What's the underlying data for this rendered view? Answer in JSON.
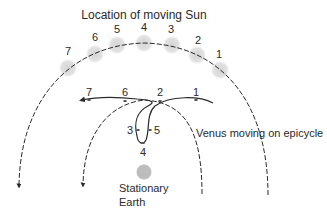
{
  "title": "Location of moving Sun",
  "sun_positions": [
    {
      "label": "7",
      "cx": 68,
      "cy": 68,
      "lx": 68,
      "ly": 55
    },
    {
      "label": "6",
      "cx": 95,
      "cy": 54,
      "lx": 95,
      "ly": 41
    },
    {
      "label": "5",
      "cx": 117,
      "cy": 45,
      "lx": 117,
      "ly": 33
    },
    {
      "label": "4",
      "cx": 144,
      "cy": 43,
      "lx": 144,
      "ly": 31
    },
    {
      "label": "3",
      "cx": 172,
      "cy": 45,
      "lx": 171,
      "ly": 33
    },
    {
      "label": "2",
      "cx": 197,
      "cy": 55,
      "lx": 198,
      "ly": 44
    },
    {
      "label": "1",
      "cx": 220,
      "cy": 70,
      "lx": 219,
      "ly": 58
    }
  ],
  "venus_positions": [
    {
      "label": "7",
      "x": 89,
      "y": 100,
      "lx": 89,
      "ly": 96
    },
    {
      "label": "6",
      "x": 125,
      "y": 101,
      "lx": 125,
      "ly": 96
    },
    {
      "label": "2",
      "x": 160,
      "y": 101,
      "lx": 160,
      "ly": 96
    },
    {
      "label": "1",
      "x": 196,
      "y": 100,
      "lx": 196,
      "ly": 96
    },
    {
      "label": "3",
      "x": 138,
      "y": 130,
      "lx": 130,
      "ly": 134
    },
    {
      "label": "5",
      "x": 150,
      "y": 130,
      "lx": 157,
      "ly": 134
    },
    {
      "label": "4",
      "x": 143,
      "y": 143,
      "lx": 143,
      "ly": 156
    }
  ],
  "venus_label": "Venus moving on epicycle",
  "earth": {
    "line1": "Stationary",
    "line2": "Earth",
    "color": "#bdbdbd"
  },
  "colors": {
    "sun_glow": "#d9d9d9",
    "line": "#2b2b2b"
  }
}
